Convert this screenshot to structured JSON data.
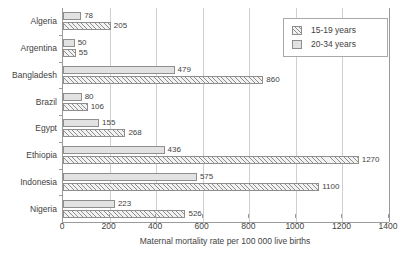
{
  "chart_data": {
    "type": "bar",
    "orientation": "horizontal",
    "title": "",
    "xlabel": "Maternal mortality rate per 100 000 live births",
    "ylabel": "",
    "xlim": [
      0,
      1400
    ],
    "xticks": [
      0,
      200,
      400,
      600,
      800,
      1000,
      1200,
      1400
    ],
    "grid": "vertical",
    "legend_position": "top-right",
    "categories": [
      "Algeria",
      "Argentina",
      "Bangladesh",
      "Brazil",
      "Egypt",
      "Ethiopia",
      "Indonesia",
      "Nigeria"
    ],
    "series": [
      {
        "name": "15-19 years",
        "pattern": "hatched",
        "values": [
          205,
          55,
          860,
          106,
          268,
          1270,
          1100,
          526
        ]
      },
      {
        "name": "20-34 years",
        "pattern": "solid",
        "values": [
          78,
          50,
          479,
          80,
          155,
          436,
          575,
          223
        ]
      }
    ]
  },
  "legend": {
    "entries": [
      {
        "label": "15-19 years",
        "pattern": "hatched"
      },
      {
        "label": "20-34 years",
        "pattern": "solid"
      }
    ]
  },
  "axis": {
    "x_title": "Maternal mortality rate per 100 000 live births",
    "x_tick_labels": [
      "0",
      "200",
      "400",
      "600",
      "800",
      "1000",
      "1200",
      "1400"
    ]
  },
  "colors": {
    "solid_fill": "#e2e2e2",
    "hatch_line": "#8e8e8e",
    "bar_border": "#8e8e8e",
    "gridline": "#cfcfcf",
    "axis": "#9a9a9a",
    "text": "#3f3f3f",
    "background": "#ffffff"
  }
}
